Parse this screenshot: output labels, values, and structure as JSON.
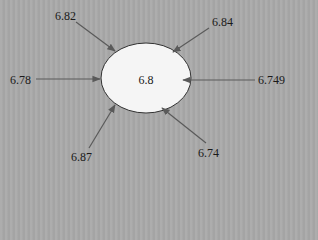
{
  "diagram": {
    "type": "converging-values",
    "center": {
      "value": "6.8"
    },
    "inputs": [
      {
        "id": "top-left",
        "value": "6.82"
      },
      {
        "id": "top-right",
        "value": "6.84"
      },
      {
        "id": "left",
        "value": "6.78"
      },
      {
        "id": "right",
        "value": "6.749"
      },
      {
        "id": "bottom-left",
        "value": "6.87"
      },
      {
        "id": "bottom-right",
        "value": "6.74"
      }
    ],
    "colors": {
      "background": "#a9a9a9",
      "ellipse_fill": "#f5f5f5",
      "ellipse_stroke": "#333333",
      "arrow": "#5a5a5a",
      "text": "#1a1a1a"
    }
  }
}
